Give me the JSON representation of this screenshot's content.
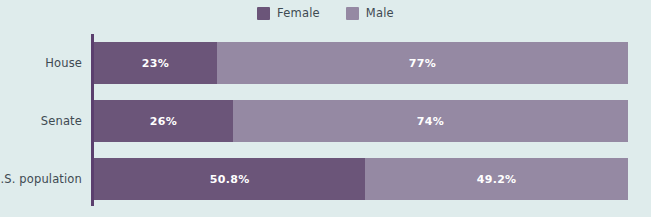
{
  "chart_data": {
    "type": "bar",
    "subtype": "stacked-horizontal-100percent",
    "title": "",
    "xlabel": "",
    "ylabel": "",
    "categories": [
      "House",
      "Senate",
      "U.S. population"
    ],
    "series": [
      {
        "name": "Female",
        "color": "#6b5579",
        "values": [
          23,
          26,
          50.8
        ],
        "labels": [
          "23%",
          "26%",
          "50.8%"
        ]
      },
      {
        "name": "Male",
        "color": "#9589a3",
        "values": [
          77,
          74,
          49.2
        ],
        "labels": [
          "77%",
          "74%",
          "49.2%"
        ]
      }
    ],
    "xlim": [
      0,
      100
    ],
    "grid": false,
    "legend_position": "top-center",
    "background_color": "#dfecec",
    "axis_color": "#5b3f6e"
  },
  "legend": {
    "items": [
      {
        "label": "Female",
        "swatch_color": "#6b5579",
        "swatch_name": "legend-swatch-female"
      },
      {
        "label": "Male",
        "swatch_color": "#9589a3",
        "swatch_name": "legend-swatch-male"
      }
    ]
  },
  "rows": [
    {
      "label": "House",
      "female": {
        "label": "23%",
        "percent": 23
      },
      "male": {
        "label": "77%",
        "percent": 77
      }
    },
    {
      "label": "Senate",
      "female": {
        "label": "26%",
        "percent": 26
      },
      "male": {
        "label": "74%",
        "percent": 74
      }
    },
    {
      "label": "U.S. population",
      "female": {
        "label": "50.8%",
        "percent": 50.8
      },
      "male": {
        "label": "49.2%",
        "percent": 49.2
      }
    }
  ]
}
